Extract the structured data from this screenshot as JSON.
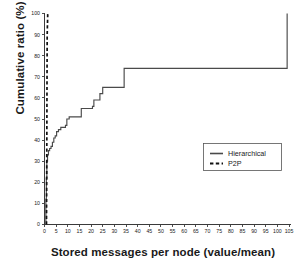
{
  "chart_data": {
    "type": "line",
    "title": "",
    "xlabel": "Stored messages per node (value/mean)",
    "ylabel": "Cumulative ratio (%)",
    "xlim": [
      0,
      105
    ],
    "ylim": [
      0,
      100
    ],
    "grid": false,
    "legend_position": "center-right",
    "xticks": [
      0,
      5,
      10,
      15,
      20,
      25,
      30,
      35,
      40,
      45,
      50,
      55,
      60,
      65,
      70,
      75,
      80,
      85,
      90,
      95,
      100,
      105
    ],
    "yticks": [
      0,
      10,
      20,
      30,
      40,
      50,
      60,
      70,
      80,
      90,
      100
    ],
    "series": [
      {
        "name": "Hierarchical",
        "style": "solid",
        "color": "#4a4a4a",
        "x": [
          0.4,
          0.6,
          0.8,
          1.0,
          1.3,
          1.7,
          2.2,
          2.8,
          3.4,
          4.0,
          4.6,
          5.2,
          6.0,
          7.0,
          8.0,
          9.0,
          9.6,
          10.6,
          13.0,
          15.2,
          15.8,
          19.0,
          20.6,
          21.2,
          23.2,
          23.8,
          24.4,
          25.0,
          33.6,
          34.2,
          103.6,
          104.2
        ],
        "y": [
          0,
          12,
          22,
          30,
          33,
          35,
          36,
          37,
          39,
          41,
          42,
          44,
          45,
          46,
          46,
          47,
          50,
          51,
          51,
          51,
          55,
          55,
          56,
          59,
          59,
          62,
          62,
          65,
          65,
          74,
          74,
          100
        ]
      },
      {
        "name": "P2P",
        "style": "dashed",
        "color": "#111111",
        "x": [
          0.85,
          0.95,
          1.05,
          1.15,
          1.4
        ],
        "y": [
          0,
          22,
          60,
          90,
          100
        ]
      }
    ]
  },
  "legend": {
    "entries": [
      {
        "label": "Hierarchical",
        "style": "solid"
      },
      {
        "label": "P2P",
        "style": "dashed"
      }
    ]
  }
}
